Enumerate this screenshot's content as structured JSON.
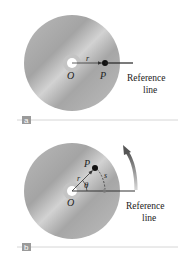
{
  "panels": [
    {
      "id": "a",
      "tag": "a",
      "origin_label": "O",
      "point_label": "P",
      "radius_label": "r",
      "reference_label_line1": "Reference",
      "reference_label_line2": "line"
    },
    {
      "id": "b",
      "tag": "b",
      "origin_label": "O",
      "point_label": "P",
      "radius_label": "r",
      "angle_label": "θ",
      "arc_label": "s",
      "reference_label_line1": "Reference",
      "reference_label_line2": "line",
      "rotation_arrow": "counterclockwise-arrow"
    }
  ],
  "colors": {
    "disc": "#a9a9a9",
    "disc_light": "#cfcfcf",
    "line": "#222222",
    "tag_bg": "#9a9a9a",
    "separator": "#cccccc",
    "arrow": "#5a5a5a"
  }
}
